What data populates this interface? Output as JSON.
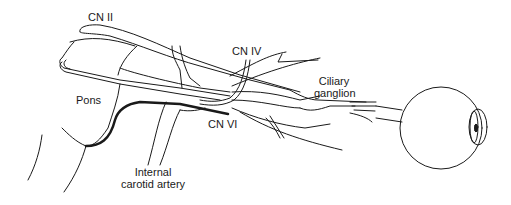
{
  "diagram": {
    "labels": {
      "cn2": "CN II",
      "cn4": "CN IV",
      "cn6": "CN VI",
      "pons": "Pons",
      "ciliary_line1": "Ciliary",
      "ciliary_line2": "ganglion",
      "carotid_line1": "Internal",
      "carotid_line2": "carotid artery"
    },
    "colors": {
      "stroke": "#1a1a1a",
      "background": "#ffffff"
    }
  }
}
